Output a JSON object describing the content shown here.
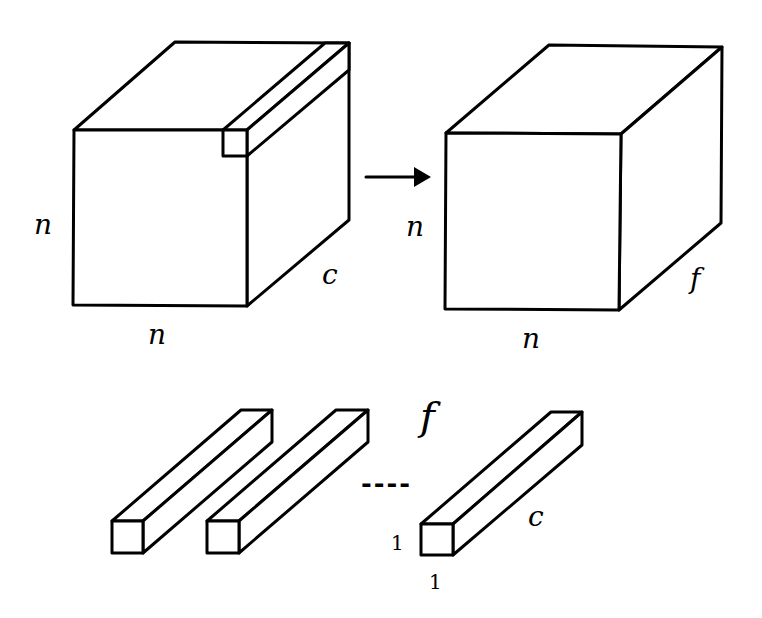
{
  "diagram": {
    "input_volume": {
      "height_label": "n",
      "width_label": "n",
      "depth_label": "c"
    },
    "arrow": {
      "direction": "right"
    },
    "output_volume": {
      "height_label": "n",
      "width_label": "n",
      "depth_label": "f"
    },
    "filters": {
      "count_label": "f",
      "ellipsis": "----",
      "filter_height_label": "1",
      "filter_width_label": "1",
      "filter_depth_label": "c",
      "visible_filters": 3
    }
  }
}
